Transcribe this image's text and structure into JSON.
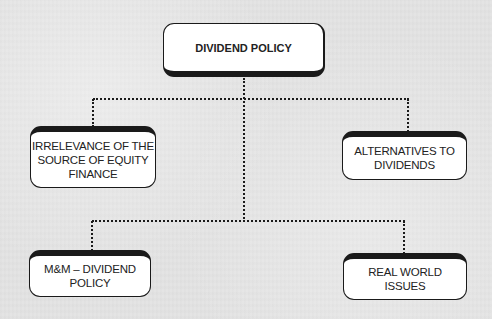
{
  "diagram": {
    "root": {
      "label": "DIVIDEND POLICY"
    },
    "children": [
      {
        "id": "irrelevance",
        "label": "IRRELEVANCE OF THE\nSOURCE OF EQUITY\nFINANCE"
      },
      {
        "id": "alternatives",
        "label": "ALTERNATIVES TO\nDIVIDENDS"
      },
      {
        "id": "mm",
        "label": "M&M – DIVIDEND\nPOLICY"
      },
      {
        "id": "real-world",
        "label": "REAL WORLD\nISSUES"
      }
    ],
    "edges": [
      {
        "from": "root",
        "to": "irrelevance"
      },
      {
        "from": "root",
        "to": "alternatives"
      },
      {
        "from": "root",
        "to": "mm"
      },
      {
        "from": "root",
        "to": "real-world"
      }
    ],
    "style": {
      "background": "#e4e4e4",
      "box_fill": "#ffffff",
      "box_border": "#1a1a1a",
      "connector": "dotted"
    }
  }
}
